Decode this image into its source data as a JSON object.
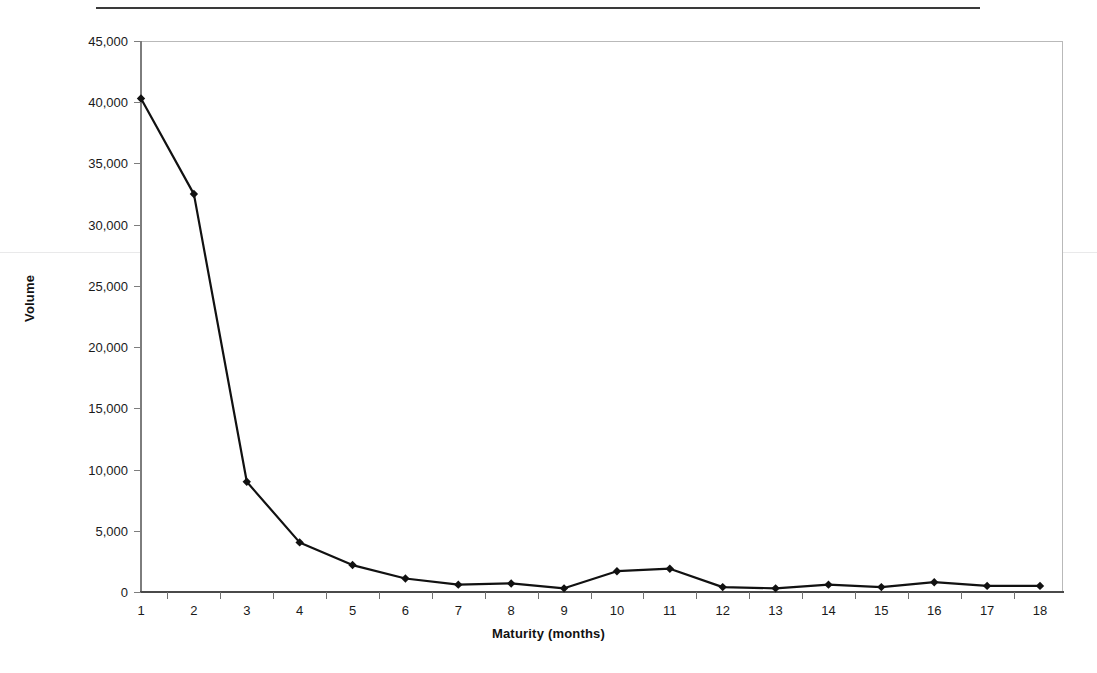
{
  "document": {
    "top_rule_present": true,
    "cut_off_header_text": ""
  },
  "chart_data": {
    "type": "line",
    "title": "",
    "xlabel": "Maturity (months)",
    "ylabel": "Volume",
    "categories": [
      1,
      2,
      3,
      4,
      5,
      6,
      7,
      8,
      9,
      10,
      11,
      12,
      13,
      14,
      15,
      16,
      17,
      18
    ],
    "category_labels": [
      "1",
      "2",
      "3",
      "4",
      "5",
      "6",
      "7",
      "8",
      "9",
      "10",
      "11",
      "12",
      "13",
      "14",
      "15",
      "16",
      "17",
      "18"
    ],
    "values": [
      40300,
      32500,
      9000,
      4050,
      2200,
      1100,
      600,
      700,
      300,
      1700,
      1900,
      400,
      300,
      600,
      400,
      800,
      500,
      500
    ],
    "ylim": [
      0,
      45000
    ],
    "ytick_values": [
      0,
      5000,
      10000,
      15000,
      20000,
      25000,
      30000,
      35000,
      40000,
      45000
    ],
    "ytick_labels": [
      "0",
      "5,000",
      "10,000",
      "15,000",
      "20,000",
      "25,000",
      "30,000",
      "35,000",
      "40,000",
      "45,000"
    ],
    "grid": false,
    "legend": null,
    "marker": "diamond",
    "series_color": "#111111",
    "line_width": 2
  }
}
